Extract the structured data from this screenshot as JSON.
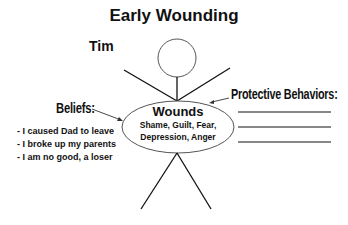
{
  "title": "Early Wounding",
  "person_name": "Tim",
  "beliefs": {
    "label": "Beliefs:",
    "items": [
      "- I caused Dad to leave",
      "- I broke up my parents",
      "- I am no good, a loser"
    ]
  },
  "wounds": {
    "title": "Wounds",
    "line1": "Shame, Guilt, Fear,",
    "line2": "Depression, Anger"
  },
  "protective_behaviors": {
    "label": "Protective Behaviors:",
    "blank_lines": 3
  }
}
